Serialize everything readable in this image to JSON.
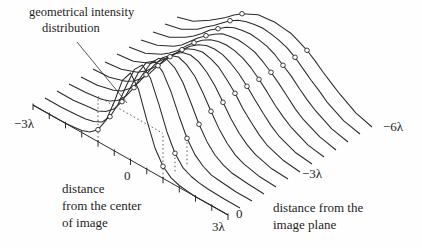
{
  "figure": {
    "annotation": {
      "line1": "geometrical intensity",
      "line2": "distribution"
    },
    "x_axis": {
      "name_line1": "distance",
      "name_line2": "from the center",
      "name_line3": "of image",
      "tick_left": "−3λ",
      "tick_center": "0",
      "tick_right": "3λ"
    },
    "depth_axis": {
      "name_line1": "distance from the",
      "name_line2": "image plane",
      "tick_front": "0",
      "tick_middle": "−3λ",
      "tick_back": "−6λ"
    }
  },
  "chart_data": {
    "type": "line",
    "subtype": "3d-waterfall",
    "title": "",
    "xlabel": "distance from the center of image",
    "depth_label": "distance from the image plane",
    "ylabel": "",
    "y_units": "arbitrary intensity (plot px, geometric level = 45)",
    "annotation": "geometrical intensity distribution",
    "x_range_lambda": [
      -3,
      3
    ],
    "x_tick_step_lambda": 0.5,
    "depth_range_lambda": [
      0,
      -6
    ],
    "depth_step_lambda": -0.5,
    "marker_x_lambda": [
      -1,
      1
    ],
    "geometric_rect": {
      "x_lambda": [
        -1,
        1
      ],
      "height_px": 45
    },
    "x_lambda": [
      -3,
      -2.5,
      -2,
      -1.75,
      -1.5,
      -1.25,
      -1,
      -0.75,
      -0.5,
      -0.25,
      0,
      0.25,
      0.5,
      0.75,
      1,
      1.25,
      1.5,
      1.75,
      2,
      2.5,
      3
    ],
    "series": [
      {
        "name": "0",
        "depth_lambda": 0,
        "y": [
          0,
          0,
          0,
          1,
          2,
          5,
          12,
          26,
          49,
          75,
          87,
          75,
          49,
          26,
          12,
          5,
          2,
          1,
          0,
          0,
          0
        ]
      },
      {
        "name": "-0.5λ",
        "depth_lambda": -0.5,
        "y": [
          0,
          0,
          1,
          2,
          4,
          8,
          18,
          35,
          58,
          79,
          88,
          79,
          58,
          35,
          18,
          8,
          4,
          2,
          1,
          0,
          0
        ]
      },
      {
        "name": "-1λ",
        "depth_lambda": -1,
        "y": [
          0,
          0,
          2,
          3,
          7,
          14,
          26,
          44,
          64,
          79,
          85,
          79,
          64,
          44,
          26,
          14,
          7,
          3,
          2,
          0,
          0
        ]
      },
      {
        "name": "-1.5λ",
        "depth_lambda": -1.5,
        "y": [
          0,
          1,
          3,
          6,
          11,
          20,
          33,
          50,
          66,
          76,
          80,
          76,
          66,
          50,
          33,
          20,
          11,
          6,
          3,
          1,
          0
        ]
      },
      {
        "name": "-2λ",
        "depth_lambda": -2,
        "y": [
          0,
          1,
          5,
          9,
          16,
          26,
          39,
          53,
          65,
          72,
          75,
          72,
          65,
          53,
          39,
          26,
          16,
          9,
          5,
          1,
          0
        ]
      },
      {
        "name": "-2.5λ",
        "depth_lambda": -2.5,
        "y": [
          1,
          2,
          7,
          12,
          19,
          29,
          41,
          53,
          62,
          68,
          70,
          68,
          62,
          53,
          41,
          29,
          19,
          12,
          7,
          2,
          1
        ]
      },
      {
        "name": "-3λ",
        "depth_lambda": -3,
        "y": [
          1,
          3,
          9,
          15,
          23,
          32,
          43,
          52,
          60,
          64,
          66,
          64,
          60,
          52,
          43,
          32,
          23,
          15,
          9,
          3,
          1
        ]
      },
      {
        "name": "-3.5λ",
        "depth_lambda": -3.5,
        "y": [
          2,
          4,
          11,
          17,
          25,
          34,
          43,
          51,
          57,
          61,
          62,
          61,
          57,
          51,
          43,
          34,
          25,
          17,
          11,
          4,
          2
        ]
      },
      {
        "name": "-4λ",
        "depth_lambda": -4,
        "y": [
          2,
          5,
          13,
          19,
          26,
          35,
          43,
          50,
          55,
          58,
          59,
          58,
          55,
          50,
          43,
          35,
          26,
          19,
          13,
          5,
          2
        ]
      },
      {
        "name": "-4.5λ",
        "depth_lambda": -4.5,
        "y": [
          2,
          6,
          14,
          20,
          28,
          36,
          43,
          49,
          54,
          56,
          57,
          56,
          54,
          49,
          43,
          36,
          28,
          20,
          14,
          6,
          2
        ]
      },
      {
        "name": "-5λ",
        "depth_lambda": -5,
        "y": [
          3,
          7,
          16,
          22,
          29,
          37,
          43,
          49,
          53,
          55,
          56,
          55,
          53,
          49,
          43,
          37,
          29,
          22,
          16,
          7,
          3
        ]
      },
      {
        "name": "-5.5λ",
        "depth_lambda": -5.5,
        "y": [
          4,
          8,
          17,
          24,
          30,
          37,
          44,
          49,
          52,
          54,
          55,
          54,
          52,
          49,
          44,
          37,
          30,
          24,
          17,
          8,
          4
        ]
      },
      {
        "name": "-6λ",
        "depth_lambda": -6,
        "y": [
          4,
          9,
          19,
          25,
          31,
          38,
          44,
          48,
          52,
          53,
          54,
          53,
          52,
          48,
          44,
          38,
          31,
          25,
          19,
          9,
          4
        ]
      }
    ],
    "layout": {
      "origin": [
        33,
        105
      ],
      "lambda_vec": [
        32.5,
        18.333
      ],
      "depth_step_vec": [
        12,
        -7
      ],
      "tick_len": 5,
      "leader_line": [
        [
          77,
          42
        ],
        [
          127,
          103
        ]
      ],
      "dotted_edge_curves": [
        1,
        2
      ],
      "colors": {
        "line": "#2b2b2b",
        "dotted": "#4a4a4a",
        "text": "#1f1f1f",
        "bg": "#fefefe"
      }
    }
  }
}
